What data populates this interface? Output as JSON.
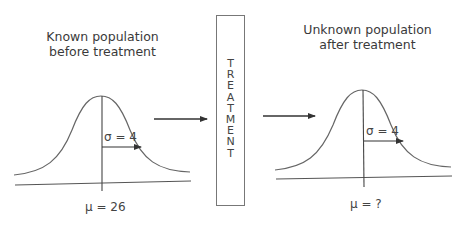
{
  "left_panel": {
    "title_line1": "Known population",
    "title_line2": "before treatment",
    "sigma_label": "σ = 4",
    "mean_label": "μ = 26"
  },
  "treatment": {
    "label": "TREATMENT",
    "letters": [
      "T",
      "R",
      "E",
      "A",
      "T",
      "M",
      "E",
      "N",
      "T"
    ]
  },
  "right_panel": {
    "title_line1": "Unknown population",
    "title_line2": "after treatment",
    "sigma_label": "σ = 4",
    "mean_label": "μ = ?"
  },
  "colors": {
    "line": "#555555",
    "text": "#3a3a3a"
  }
}
